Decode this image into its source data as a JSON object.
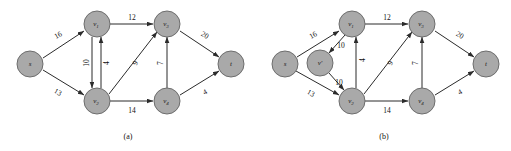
{
  "figure": {
    "background_color": "#ffffff",
    "node_fill_color": "#a9a9a9",
    "node_stroke_color": "#6d6d6d",
    "edge_color": "#2b2b2b",
    "text_color": "#111111"
  },
  "panels": [
    {
      "id": "panel-a",
      "caption": "(a)",
      "nodes": [
        {
          "id": "s",
          "label": "s",
          "sub": "",
          "cx": 30,
          "cy": 64
        },
        {
          "id": "v1",
          "label": "v",
          "sub": "1",
          "cx": 97,
          "cy": 24
        },
        {
          "id": "v3",
          "label": "v",
          "sub": "3",
          "cx": 167,
          "cy": 24
        },
        {
          "id": "t",
          "label": "t",
          "sub": "",
          "cx": 231,
          "cy": 64
        },
        {
          "id": "v2",
          "label": "v",
          "sub": "2",
          "cx": 97,
          "cy": 101
        },
        {
          "id": "v4",
          "label": "v",
          "sub": "4",
          "cx": 167,
          "cy": 101
        }
      ],
      "edges": [
        {
          "from": "s",
          "to": "v1",
          "weight": "16",
          "label_x": 58,
          "label_y": 35,
          "rotate": -29
        },
        {
          "from": "s",
          "to": "v2",
          "weight": "13",
          "label_x": 58,
          "label_y": 92,
          "rotate": 29
        },
        {
          "from": "v1",
          "to": "v3",
          "weight": "12",
          "label_x": 132,
          "label_y": 17,
          "rotate": 0
        },
        {
          "from": "v1",
          "to": "v2",
          "weight": "10",
          "label_x": 86,
          "label_y": 63,
          "rotate": -90
        },
        {
          "from": "v2",
          "to": "v1",
          "weight": "4",
          "label_x": 104,
          "label_y": 63,
          "rotate": -90
        },
        {
          "from": "v2",
          "to": "v3",
          "weight": "9",
          "label_x": 135,
          "label_y": 63,
          "rotate": -63
        },
        {
          "from": "v2",
          "to": "v4",
          "weight": "14",
          "label_x": 132,
          "label_y": 110,
          "rotate": 0
        },
        {
          "from": "v4",
          "to": "v3",
          "weight": "7",
          "label_x": 160,
          "label_y": 63,
          "rotate": -90
        },
        {
          "from": "v3",
          "to": "t",
          "weight": "20",
          "label_x": 205,
          "label_y": 35,
          "rotate": 29
        },
        {
          "from": "v4",
          "to": "t",
          "weight": "4",
          "label_x": 205,
          "label_y": 92,
          "rotate": -29
        }
      ]
    },
    {
      "id": "panel-b",
      "caption": "(b)",
      "nodes": [
        {
          "id": "s",
          "label": "s",
          "sub": "",
          "cx": 285,
          "cy": 64
        },
        {
          "id": "vp",
          "label": "v'",
          "sub": "",
          "cx": 320,
          "cy": 63
        },
        {
          "id": "v1",
          "label": "v",
          "sub": "1",
          "cx": 352,
          "cy": 24
        },
        {
          "id": "v3",
          "label": "v",
          "sub": "3",
          "cx": 422,
          "cy": 24
        },
        {
          "id": "t",
          "label": "t",
          "sub": "",
          "cx": 486,
          "cy": 64
        },
        {
          "id": "v2",
          "label": "v",
          "sub": "2",
          "cx": 352,
          "cy": 101
        },
        {
          "id": "v4",
          "label": "v",
          "sub": "4",
          "cx": 422,
          "cy": 101
        }
      ],
      "edges": [
        {
          "from": "s",
          "to": "v1",
          "weight": "16",
          "label_x": 313,
          "label_y": 35,
          "rotate": -29
        },
        {
          "from": "s",
          "to": "v2",
          "weight": "13",
          "label_x": 313,
          "label_y": 92,
          "rotate": 29
        },
        {
          "from": "v1",
          "to": "vp",
          "weight": "10",
          "label_x": 341,
          "label_y": 46,
          "rotate": 0
        },
        {
          "from": "vp",
          "to": "v2",
          "weight": "10",
          "label_x": 341,
          "label_y": 83,
          "rotate": 0
        },
        {
          "from": "v1",
          "to": "v3",
          "weight": "12",
          "label_x": 387,
          "label_y": 17,
          "rotate": 0
        },
        {
          "from": "v2",
          "to": "v1",
          "weight": "4",
          "label_x": 359,
          "label_y": 63,
          "rotate": -90
        },
        {
          "from": "v2",
          "to": "v3",
          "weight": "9",
          "label_x": 390,
          "label_y": 63,
          "rotate": -63
        },
        {
          "from": "v2",
          "to": "v4",
          "weight": "14",
          "label_x": 387,
          "label_y": 110,
          "rotate": 0
        },
        {
          "from": "v4",
          "to": "v3",
          "weight": "7",
          "label_x": 415,
          "label_y": 63,
          "rotate": -90
        },
        {
          "from": "v3",
          "to": "t",
          "weight": "20",
          "label_x": 460,
          "label_y": 35,
          "rotate": 29
        },
        {
          "from": "v4",
          "to": "t",
          "weight": "4",
          "label_x": 460,
          "label_y": 92,
          "rotate": -29
        }
      ]
    }
  ],
  "captions": {
    "panel_a": "(a)",
    "panel_b": "(b)"
  }
}
